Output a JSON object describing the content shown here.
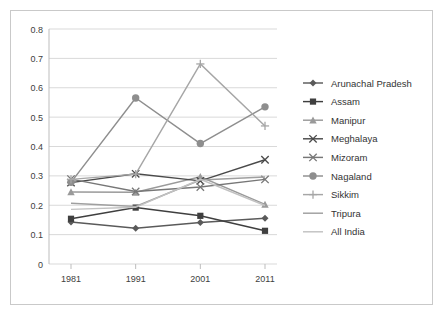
{
  "chart_data": {
    "type": "line",
    "title": "",
    "xlabel": "",
    "ylabel": "",
    "categories": [
      "1981",
      "1991",
      "2001",
      "2011"
    ],
    "x_tick_labels": [
      "1981",
      "1991",
      "2001",
      "2011"
    ],
    "y_tick_labels": [
      "0",
      "0.1",
      "0.2",
      "0.3",
      "0.4",
      "0.5",
      "0.6",
      "0.7",
      "0.8"
    ],
    "ylim": [
      0,
      0.8
    ],
    "y_tick_step": 0.1,
    "grid": true,
    "legend_position": "right",
    "series": [
      {
        "name": "Arunachal Pradesh",
        "values": [
          0.143,
          0.122,
          0.141,
          0.156
        ],
        "color": "#5a5a5a",
        "marker": "diamond"
      },
      {
        "name": "Assam",
        "values": [
          0.154,
          0.192,
          0.164,
          0.113
        ],
        "color": "#3f3f3f",
        "marker": "square"
      },
      {
        "name": "Manipur",
        "values": [
          0.245,
          0.244,
          0.297,
          0.203
        ],
        "color": "#9a9a9a",
        "marker": "triangle"
      },
      {
        "name": "Meghalaya",
        "values": [
          0.277,
          0.307,
          0.283,
          0.355
        ],
        "color": "#4a4a4a",
        "marker": "cross"
      },
      {
        "name": "Mizoram",
        "values": [
          0.289,
          0.247,
          0.262,
          0.288
        ],
        "color": "#777777",
        "marker": "cross"
      },
      {
        "name": "Nagaland",
        "values": [
          0.278,
          0.565,
          0.41,
          0.535
        ],
        "color": "#8e8e8e",
        "marker": "circle"
      },
      {
        "name": "Sikkim",
        "values": [
          0.288,
          0.306,
          0.681,
          0.47
        ],
        "color": "#a6a6a6",
        "marker": "plus"
      },
      {
        "name": "Tripura",
        "values": [
          0.207,
          0.196,
          0.286,
          0.296
        ],
        "color": "#9f9f9f",
        "marker": "none"
      },
      {
        "name": "All India",
        "values": [
          0.186,
          0.193,
          0.288,
          0.199
        ],
        "color": "#c2c2c2",
        "marker": "none"
      }
    ]
  },
  "legend": {
    "items": [
      {
        "label": "Arunachal Pradesh"
      },
      {
        "label": "Assam"
      },
      {
        "label": "Manipur"
      },
      {
        "label": "Meghalaya"
      },
      {
        "label": "Mizoram"
      },
      {
        "label": "Nagaland"
      },
      {
        "label": "Sikkim"
      },
      {
        "label": "Tripura"
      },
      {
        "label": "All India"
      }
    ]
  }
}
